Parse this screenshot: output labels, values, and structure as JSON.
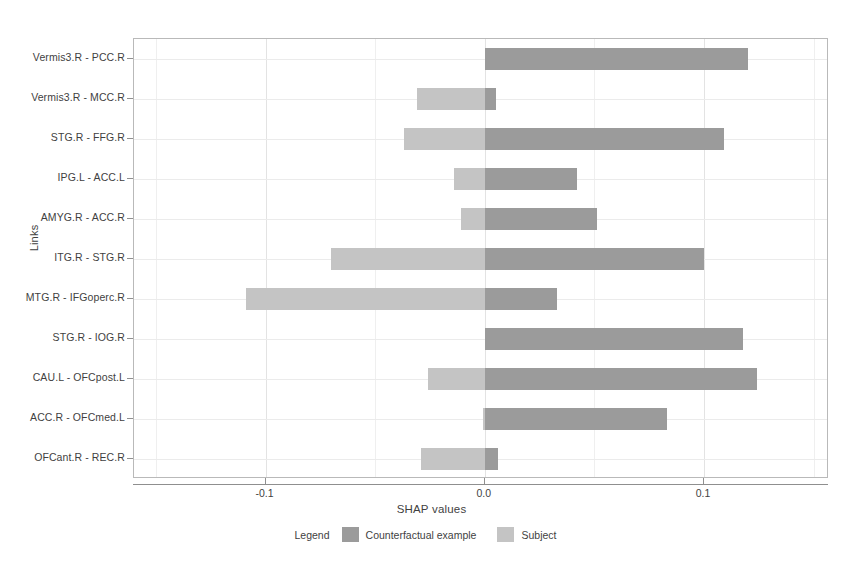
{
  "chart_data": {
    "type": "bar",
    "orientation": "horizontal",
    "title": "",
    "xlabel": "SHAP values",
    "ylabel": "Links",
    "xlim": [
      -0.16,
      0.157
    ],
    "xticks": [
      -0.1,
      0.0,
      0.1
    ],
    "xticklabels": [
      "-0.1",
      "0.0",
      "0.1"
    ],
    "grid": true,
    "legend_position": "bottom",
    "legend_title": "Legend",
    "categories": [
      "Vermis3.R - PCC.R",
      "Vermis3.R - MCC.R",
      "STG.R - FFG.R",
      "IPG.L - ACC.L",
      "AMYG.R - ACC.R",
      "ITG.R - STG.R",
      "MTG.R - IFGoperc.R",
      "STG.R - IOG.R",
      "CAU.L - OFCpost.L",
      "ACC.R - OFCmed.L",
      "OFCant.R - REC.R"
    ],
    "series": [
      {
        "name": "Counterfactual example",
        "color": "#9b9b9b",
        "values": [
          0.12,
          0.005,
          0.109,
          0.042,
          0.051,
          0.1,
          0.033,
          0.118,
          0.124,
          0.083,
          0.006
        ]
      },
      {
        "name": "Subject",
        "color": "#c4c4c4",
        "values": [
          0.0,
          -0.031,
          -0.037,
          -0.014,
          -0.011,
          -0.07,
          -0.109,
          0.0,
          -0.026,
          -0.001,
          -0.029
        ]
      }
    ]
  },
  "legend": {
    "title": "Legend",
    "entries": [
      {
        "label": "Counterfactual example",
        "color": "#9b9b9b"
      },
      {
        "label": "Subject",
        "color": "#c4c4c4"
      }
    ]
  },
  "axes": {
    "x_title": "SHAP values",
    "y_title": "Links"
  }
}
